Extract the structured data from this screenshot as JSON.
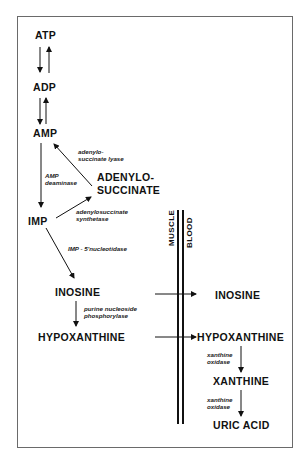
{
  "diagram": {
    "compartments": {
      "left": "MUSCLE",
      "right": "BLOOD"
    },
    "nodes": {
      "atp": "ATP",
      "adp": "ADP",
      "amp": "AMP",
      "adenylosuccinate_1": "ADENYLO-",
      "adenylosuccinate_2": "SUCCINATE",
      "imp": "IMP",
      "inosine_muscle": "INOSINE",
      "hypoxanthine_muscle": "HYPOXANTHINE",
      "inosine_blood": "INOSINE",
      "hypoxanthine_blood": "HYPOXANTHINE",
      "xanthine": "XANTHINE",
      "uric_acid": "URIC ACID"
    },
    "enzymes": {
      "adenylosuccinate_lyase_1": "adenylo-",
      "adenylosuccinate_lyase_2": "succinate lyase",
      "amp_deaminase_1": "AMP",
      "amp_deaminase_2": "deaminase",
      "adenylosuccinate_synthetase_1": "adenylosuccinate",
      "adenylosuccinate_synthetase_2": "synthetase",
      "imp_5_nucleotidase": "IMP - 5'nucleotidase",
      "purine_nucleoside_phosphorylase_1": "purine nucleoside",
      "purine_nucleoside_phosphorylase_2": "phosphorylase",
      "xanthine_oxidase_a1": "xanthine",
      "xanthine_oxidase_a2": "oxidase",
      "xanthine_oxidase_b1": "xanthine",
      "xanthine_oxidase_b2": "oxidase"
    },
    "edges": [
      {
        "from": "ATP",
        "to": "ADP",
        "bidirectional": true
      },
      {
        "from": "ADP",
        "to": "AMP",
        "bidirectional": true
      },
      {
        "from": "AMP",
        "to": "IMP",
        "enzyme": "AMP deaminase"
      },
      {
        "from": "IMP",
        "to": "ADENYLOSUCCINATE",
        "enzyme": "adenylosuccinate synthetase"
      },
      {
        "from": "ADENYLOSUCCINATE",
        "to": "AMP",
        "enzyme": "adenylosuccinate lyase"
      },
      {
        "from": "IMP",
        "to": "INOSINE",
        "enzyme": "IMP - 5'nucleotidase"
      },
      {
        "from": "INOSINE",
        "to": "HYPOXANTHINE",
        "enzyme": "purine nucleoside phosphorylase"
      },
      {
        "from": "INOSINE (muscle)",
        "to": "INOSINE (blood)"
      },
      {
        "from": "HYPOXANTHINE (muscle)",
        "to": "HYPOXANTHINE (blood)"
      },
      {
        "from": "HYPOXANTHINE",
        "to": "XANTHINE",
        "enzyme": "xanthine oxidase"
      },
      {
        "from": "XANTHINE",
        "to": "URIC ACID",
        "enzyme": "xanthine oxidase"
      }
    ]
  }
}
